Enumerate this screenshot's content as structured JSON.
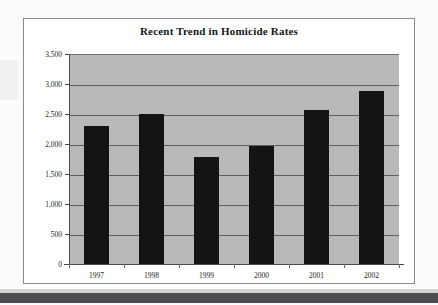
{
  "chart_data": {
    "type": "bar",
    "title": "Recent Trend in Homicide Rates",
    "xlabel": "",
    "ylabel": "",
    "categories": [
      "1997",
      "1998",
      "1999",
      "2000",
      "2001",
      "2002"
    ],
    "values": [
      2300,
      2500,
      1790,
      1975,
      2570,
      2880
    ],
    "ylim": [
      0,
      3500
    ],
    "ytick_values": [
      0,
      500,
      1000,
      1500,
      2000,
      2500,
      3000,
      3500
    ],
    "ytick_labels": [
      "0",
      "500",
      "1,000",
      "1,500",
      "2,000",
      "2,500",
      "3,000",
      "3,500"
    ],
    "grid": true,
    "legend": false,
    "colors": {
      "bar": "#141414",
      "plot_background": "#b9b9b9",
      "gridline": "#5f5f5f",
      "frame": "#8a8a8a",
      "text": "#1a1a1a",
      "page_background": "#fbfbfb"
    }
  }
}
